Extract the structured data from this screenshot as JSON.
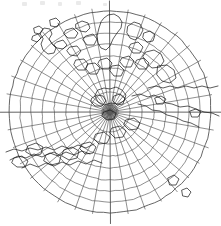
{
  "figure": {
    "background_color": "#ffffff",
    "line_color": "#2a2a2a",
    "graticule_color": "#4a4a4a",
    "coast_color": "#1a1a1a",
    "smudge_color": "#d8d8d8",
    "width": 221,
    "height": 226
  },
  "projection": {
    "type": "azimuthal-polar",
    "center_label": "pole",
    "center_x": 110,
    "center_y": 112,
    "outer_radius": 101,
    "meridian_count": 36,
    "meridian_spacing_degrees": 10,
    "parallel_count": 9,
    "parallel_spacing_degrees": 10,
    "parallel_radii": [
      8,
      20,
      32,
      44,
      56,
      68,
      79,
      90,
      101
    ],
    "equator_line": "horizontal",
    "grid_visible": true,
    "labels_visible": false
  },
  "artifacts": {
    "top_edge_marks": [
      {
        "x": 22,
        "y": 2,
        "w": 5,
        "h": 4
      },
      {
        "x": 40,
        "y": 1,
        "w": 5,
        "h": 4
      },
      {
        "x": 58,
        "y": 2,
        "w": 4,
        "h": 4
      },
      {
        "x": 76,
        "y": 1,
        "w": 5,
        "h": 4
      },
      {
        "x": 103,
        "y": 3,
        "w": 4,
        "h": 3
      }
    ],
    "note": "faint illegible scan smudges along the top margin"
  }
}
